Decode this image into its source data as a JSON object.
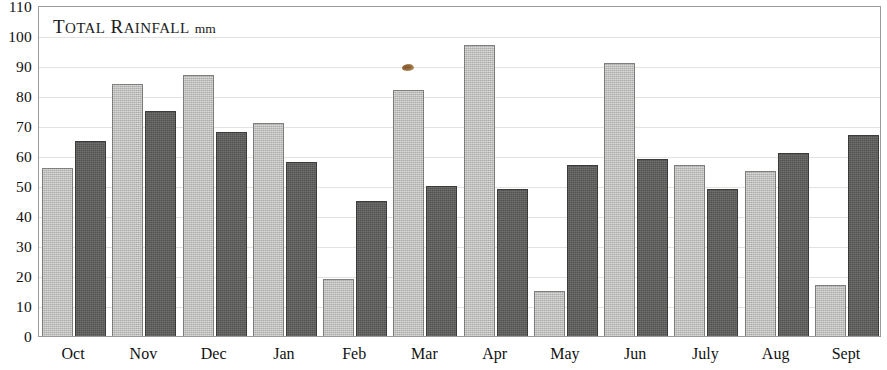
{
  "chart_data": {
    "type": "bar",
    "title_parts": {
      "word1_cap": "T",
      "word1_rest": "OTAL",
      "word2_cap": "R",
      "word2_rest": "AINFALL",
      "unit": "mm"
    },
    "xlabel": "",
    "ylabel": "",
    "ylim": [
      0,
      110
    ],
    "ytick_step": 10,
    "grid": true,
    "legend": "none",
    "categories": [
      "Oct",
      "Nov",
      "Dec",
      "Jan",
      "Feb",
      "Mar",
      "Apr",
      "May",
      "Jun",
      "July",
      "Aug",
      "Sept"
    ],
    "ytick_labels": [
      "110",
      "100",
      "90",
      "80",
      "70",
      "60",
      "50",
      "40",
      "30",
      "20",
      "10",
      "0"
    ],
    "series": [
      {
        "name": "Series 1",
        "color": "#b9b9b7",
        "values": [
          56,
          84,
          87,
          71,
          19,
          82,
          97,
          15,
          91,
          57,
          55,
          17
        ]
      },
      {
        "name": "Series 2",
        "color": "#5d5d5c",
        "values": [
          65,
          75,
          68,
          58,
          45,
          50,
          49,
          57,
          59,
          49,
          61,
          67
        ]
      }
    ],
    "annotations": [
      {
        "name": "scan-speck",
        "kind": "artifact",
        "color": "#8a5a28"
      }
    ]
  }
}
